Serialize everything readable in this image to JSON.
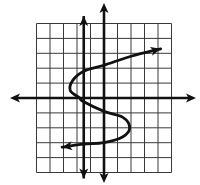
{
  "figure": {
    "title": "",
    "colors": {
      "background": "#ffffff",
      "ink": "#111111",
      "grid": "#3a3a3a"
    }
  },
  "chart_data": {
    "type": "line",
    "title": "",
    "xlabel": "",
    "ylabel": "",
    "xlim": [
      -5,
      5
    ],
    "ylim": [
      -5,
      5
    ],
    "grid": true,
    "tick_labels": false,
    "series": [
      {
        "name": "curve",
        "description": "Sideways S-shaped curve (x as function of y), arrows at both ends",
        "points": [
          [
            -3.1,
            -3.3
          ],
          [
            -1.5,
            -3.1
          ],
          [
            0,
            -3.0
          ],
          [
            1.4,
            -2.6
          ],
          [
            1.9,
            -2.0
          ],
          [
            1.4,
            -1.3
          ],
          [
            0,
            -0.9
          ],
          [
            -1.6,
            -0.2
          ],
          [
            -1.8,
            0
          ],
          [
            -2.5,
            0.5
          ],
          [
            -2.3,
            1.2
          ],
          [
            -1.5,
            1.8
          ],
          [
            0,
            2.2
          ],
          [
            2.0,
            2.8
          ],
          [
            4.2,
            3.3
          ]
        ],
        "arrows": "both"
      },
      {
        "name": "vertical-line",
        "description": "Vertical line x = -1.5 with arrows at both ends",
        "points": [
          [
            -1.5,
            -5.4
          ],
          [
            -1.5,
            5.5
          ]
        ],
        "arrows": "both"
      }
    ]
  },
  "layout": {
    "origin_px": [
      104,
      98
    ],
    "unit_x_px": 13.5,
    "unit_y_px": 14.9,
    "x_axis_px": [
      10,
      196
    ],
    "y_axis_px": [
      3,
      183
    ]
  }
}
